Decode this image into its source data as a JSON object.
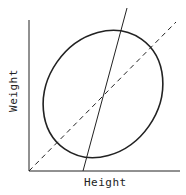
{
  "diagram": {
    "x_axis_label": "Height",
    "y_axis_label": "Weight",
    "elements": [
      "ellipse",
      "solid-line",
      "dashed-line"
    ],
    "colors": {
      "stroke": "#222222",
      "background": "#ffffff"
    }
  }
}
